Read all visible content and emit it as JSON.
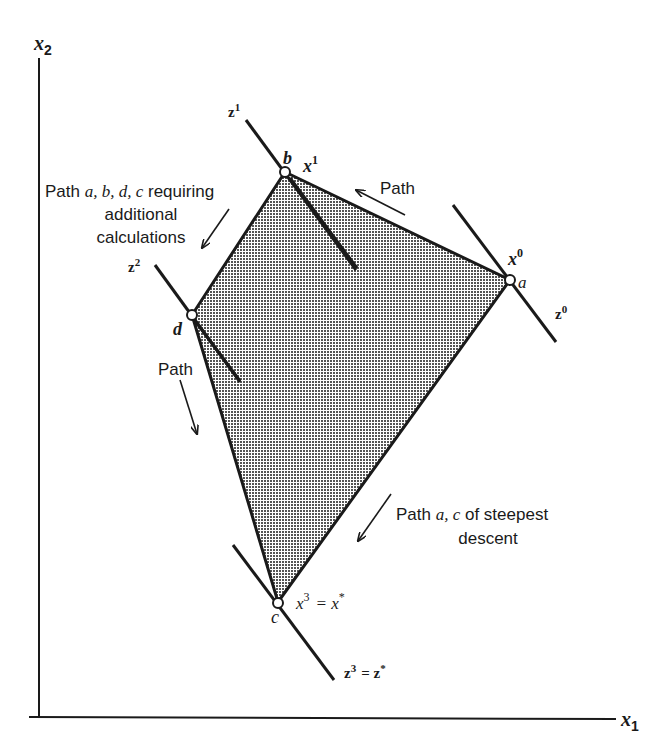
{
  "axes": {
    "x_label": "x",
    "x_sub": "1",
    "y_label": "x",
    "y_sub": "2"
  },
  "vertices": {
    "a": {
      "label": "a",
      "iter_label": "x",
      "iter_sup": "0"
    },
    "b": {
      "label": "b",
      "iter_label": "x",
      "iter_sup": "1"
    },
    "c": {
      "label": "c",
      "iter_label": "x",
      "iter_sup": "3",
      "eq": "= x",
      "eq_sup": "*"
    },
    "d": {
      "label": "d"
    }
  },
  "contours": {
    "z0": {
      "label": "z",
      "sup": "0"
    },
    "z1": {
      "label": "z",
      "sup": "1"
    },
    "z2": {
      "label": "z",
      "sup": "2"
    },
    "z3": {
      "label": "z",
      "sup": "3",
      "eq": "= z",
      "eq_sup": "*"
    }
  },
  "annotations": {
    "path_top": "Path",
    "path_left": "Path",
    "path_abdc_prefix": "Path ",
    "path_abdc_italic": "a, b, d, c",
    "path_abdc_suffix": " requiring",
    "path_abdc_line2": "additional",
    "path_abdc_line3": "calculations",
    "path_ac_prefix": "Path ",
    "path_ac_italic": "a, c",
    "path_ac_suffix": " of steepest",
    "path_ac_line2": "descent"
  },
  "colors": {
    "ink": "#1a1a1a",
    "region_fill": "#9a9a9a"
  }
}
